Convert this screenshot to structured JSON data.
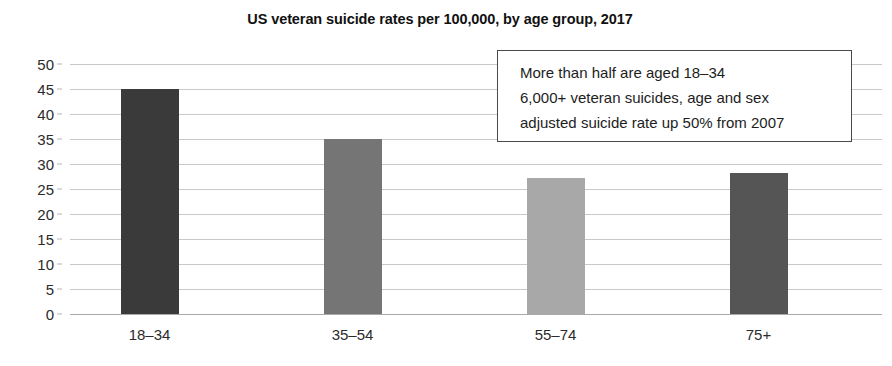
{
  "chart_data": {
    "type": "bar",
    "title": "US veteran suicide rates per 100,000, by age group, 2017",
    "xlabel": "",
    "ylabel": "",
    "categories": [
      "18–34",
      "35–54",
      "55–74",
      "75+"
    ],
    "values": [
      45.0,
      35.0,
      27.3,
      28.3
    ],
    "bar_colors": [
      "#3a3a3a",
      "#757575",
      "#a8a8a8",
      "#555555"
    ],
    "ylim": [
      0,
      50
    ],
    "ytick_step": 5,
    "ytick_labels": [
      "50",
      "45",
      "40",
      "35",
      "30",
      "25",
      "20",
      "15",
      "10",
      "5",
      "0"
    ],
    "ytick_values": [
      50,
      45,
      40,
      35,
      30,
      25,
      20,
      15,
      10,
      5,
      0
    ],
    "grid": true,
    "grid_color": "#c9c9c9",
    "legend": false,
    "annotations": [
      {
        "name": "callout-box",
        "lines": [
          "More than half are aged 18–34",
          "6,000+ veteran suicides, age and sex",
          "adjusted suicide rate up 50% from 2007"
        ],
        "border_color": "#4a4a4a",
        "background": "#ffffff"
      }
    ]
  }
}
